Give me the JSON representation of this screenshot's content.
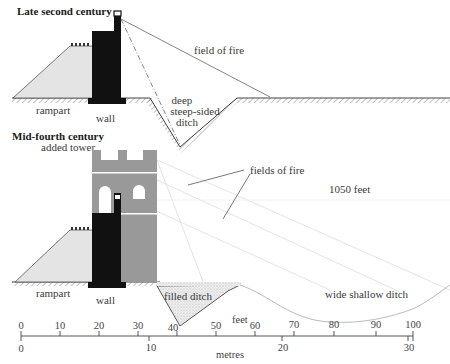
{
  "panels": {
    "top": {
      "title": "Late second century",
      "labels": {
        "rampart": "rampart",
        "wall": "wall",
        "field_of_fire": "field of fire",
        "ditch_line1": "deep",
        "ditch_line2": "steep-sided",
        "ditch_line3": "ditch"
      }
    },
    "bottom": {
      "title": "Mid-fourth century",
      "labels": {
        "added_tower": "added tower",
        "fields_of_fire": "fields of fire",
        "distance": "1050 feet",
        "rampart": "rampart",
        "wall": "wall",
        "filled_ditch": "filled ditch",
        "wide_ditch": "wide shallow ditch"
      }
    }
  },
  "scale": {
    "feet_label": "feet",
    "metres_label": "metres",
    "feet_ticks": [
      "0",
      "10",
      "20",
      "30",
      "40",
      "50",
      "60",
      "70",
      "80",
      "90",
      "100"
    ],
    "metres_ticks": [
      "0",
      "10",
      "20",
      "30"
    ]
  },
  "colors": {
    "wall": "#111111",
    "tower": "#9a9a9a",
    "rampart_fill": "#e6e6e6",
    "ground_hatch": "#555555"
  }
}
